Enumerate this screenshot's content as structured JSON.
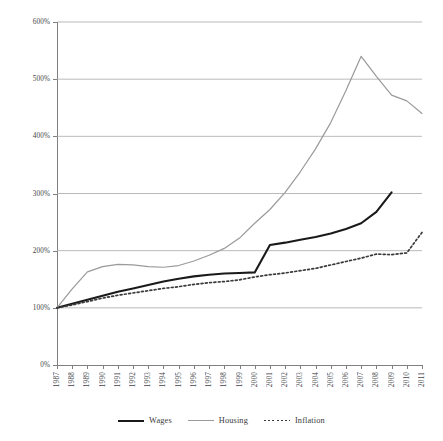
{
  "chart_data": {
    "type": "line",
    "title": "",
    "subtitle": "",
    "xlabel": "",
    "ylabel": "",
    "xlim": [
      1987,
      2011
    ],
    "ylim": [
      0,
      600
    ],
    "grid": true,
    "legend_position": "bottom",
    "y_tick_labels": [
      "600%",
      "500%",
      "400%",
      "300%",
      "200%",
      "100%",
      "0%"
    ],
    "y_tick_values": [
      600,
      500,
      400,
      300,
      200,
      100,
      0
    ],
    "x": [
      1987,
      1988,
      1989,
      1990,
      1991,
      1992,
      1993,
      1994,
      1995,
      1996,
      1997,
      1998,
      1999,
      2000,
      2001,
      2002,
      2003,
      2004,
      2005,
      2006,
      2007,
      2008,
      2009,
      2010,
      2011
    ],
    "x_tick_labels": [
      "1987",
      "1988",
      "1989",
      "1990",
      "1991",
      "1992",
      "1993",
      "1994",
      "1995",
      "1996",
      "1997",
      "1998",
      "1999",
      "2000",
      "2001",
      "2002",
      "2003",
      "2004",
      "2005",
      "2006",
      "2007",
      "2008",
      "2009",
      "2010",
      "2011"
    ],
    "series": [
      {
        "name": "Wages",
        "color": "#1a1a1a",
        "style": "solid",
        "width": 2.1,
        "values": [
          100,
          107,
          114,
          121,
          128,
          134,
          140,
          146,
          151,
          155,
          158,
          160,
          161,
          162,
          210,
          214,
          219,
          224,
          230,
          238,
          248,
          268,
          302,
          null,
          null
        ]
      },
      {
        "name": "Housing",
        "color": "#9a9a9a",
        "style": "solid",
        "width": 1.2,
        "values": [
          100,
          133,
          163,
          172,
          176,
          175,
          172,
          171,
          174,
          182,
          192,
          204,
          222,
          248,
          272,
          302,
          338,
          378,
          424,
          480,
          540,
          505,
          472,
          462,
          440
        ]
      },
      {
        "name": "Inflation",
        "color": "#3a3a3a",
        "style": "dotted",
        "width": 1.7,
        "values": [
          100,
          105,
          111,
          117,
          122,
          126,
          130,
          134,
          137,
          141,
          144,
          146,
          149,
          154,
          158,
          161,
          165,
          169,
          175,
          181,
          187,
          194,
          193,
          196,
          232
        ]
      }
    ]
  },
  "legend": {
    "items": [
      {
        "label": "Wages",
        "key": "wages"
      },
      {
        "label": "Housing",
        "key": "housing"
      },
      {
        "label": "Inflation",
        "key": "inflation"
      }
    ]
  }
}
